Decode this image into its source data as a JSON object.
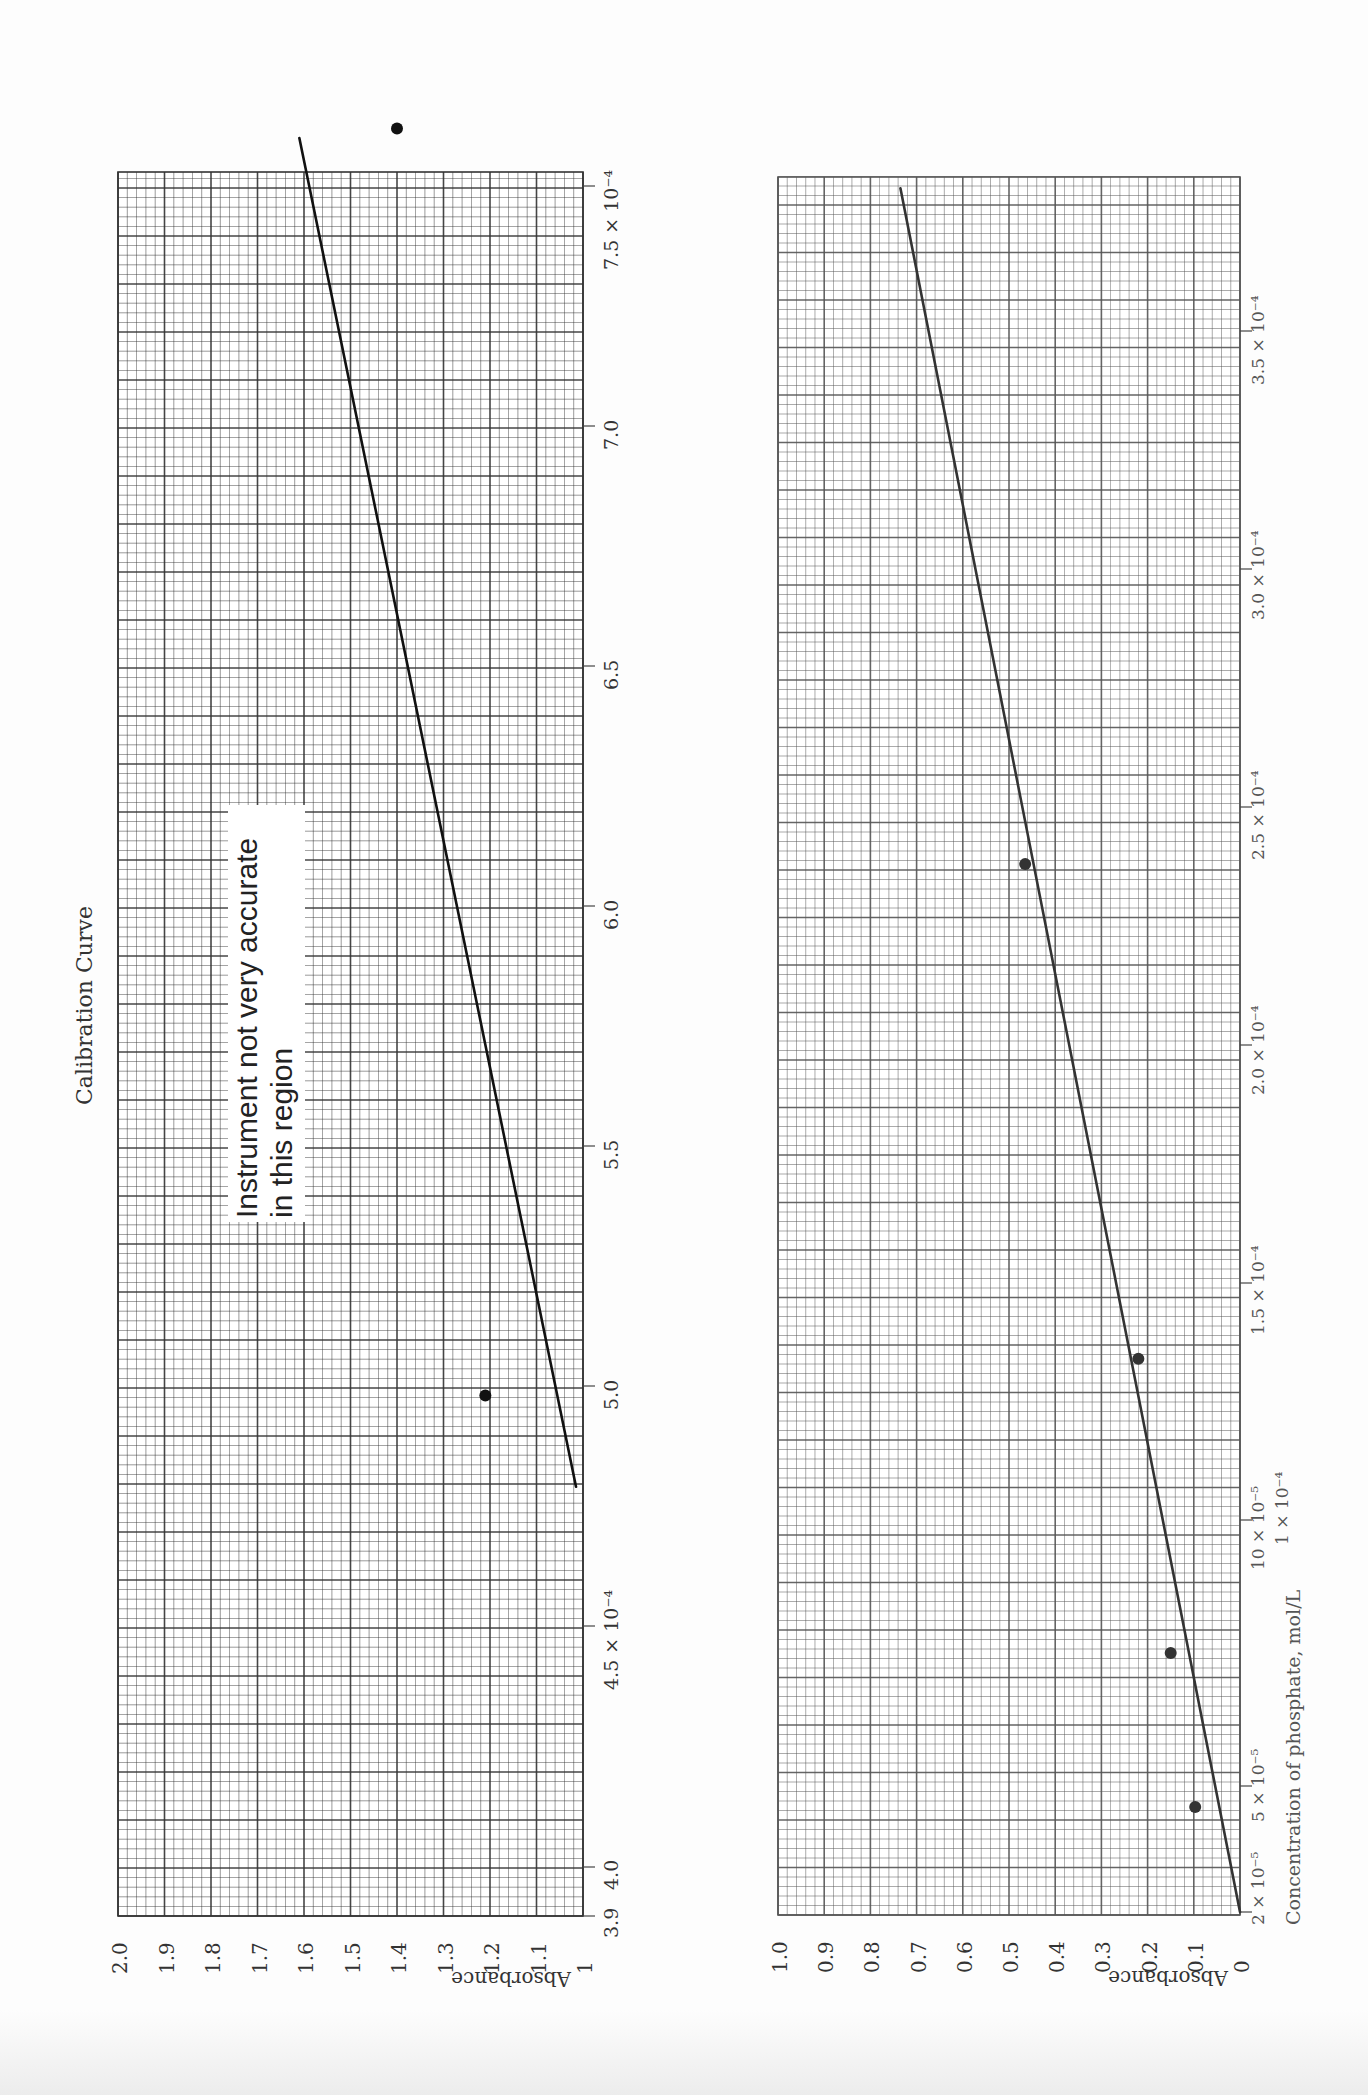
{
  "title": "Calibration Curve",
  "annotation": [
    "Instrument not very accurate",
    "in this region"
  ],
  "chart_data": [
    {
      "type": "scatter",
      "title": "Calibration Curve",
      "xlabel": "",
      "ylabel": "Absorbance",
      "xlim": [
        0.00039,
        0.000765
      ],
      "ylim": [
        1.0,
        2.0
      ],
      "x_tick_labels": [
        "3.9",
        "4.0",
        "4.5 × 10⁻⁴",
        "5.0",
        "5.5",
        "6.0",
        "6.5",
        "7.0",
        "7.5 × 10⁻⁴"
      ],
      "x_ticks": [
        0.00039,
        0.0004,
        0.00045,
        0.0005,
        0.00055,
        0.0006,
        0.00065,
        0.0007,
        0.00075
      ],
      "y_tick_labels": [
        "2.0",
        "1.9",
        "1.8",
        "1.7",
        "1.6",
        "1.5",
        "1.4",
        "1.3",
        "1.2",
        "1.1",
        "1"
      ],
      "y_ticks": [
        2.0,
        1.9,
        1.8,
        1.7,
        1.6,
        1.5,
        1.4,
        1.3,
        1.2,
        1.1,
        1.0
      ],
      "grid": true,
      "points": [
        {
          "x": 0.000498,
          "y": 1.21
        },
        {
          "x": 0.000762,
          "y": 1.4
        }
      ],
      "fit_line": {
        "x": [
          0.000479,
          0.00076
        ],
        "y": [
          1.015,
          1.61
        ]
      },
      "annotation": "Instrument not very accurate in this region"
    },
    {
      "type": "scatter",
      "title": "",
      "xlabel": "Concentration of phosphate, mol/L",
      "ylabel": "Absorbance",
      "xlim": [
        2e-05,
        0.000385
      ],
      "ylim": [
        0.0,
        1.0
      ],
      "x_tick_labels": [
        "2 × 10⁻⁵",
        "5 × 10⁻⁵",
        "10 × 10⁻⁵ / 1 × 10⁻⁴",
        "1.5 × 10⁻⁴",
        "2.0 × 10⁻⁴",
        "2.5 × 10⁻⁴",
        "3.0 × 10⁻⁴",
        "3.5 × 10⁻⁴"
      ],
      "x_ticks": [
        2e-05,
        5e-05,
        0.0001,
        0.00015,
        0.0002,
        0.00025,
        0.0003,
        0.00035
      ],
      "y_tick_labels": [
        "1.0",
        "0.9",
        "0.8",
        "0.7",
        "0.6",
        "0.5",
        "0.4",
        "0.3",
        "0.2",
        "0.1",
        "0"
      ],
      "y_ticks": [
        1.0,
        0.9,
        0.8,
        0.7,
        0.6,
        0.5,
        0.4,
        0.3,
        0.2,
        0.1,
        0.0
      ],
      "grid": true,
      "points": [
        {
          "x": 4.5e-05,
          "y": 0.097
        },
        {
          "x": 7.5e-05,
          "y": 0.15
        },
        {
          "x": 0.000134,
          "y": 0.22
        },
        {
          "x": 0.000238,
          "y": 0.465
        }
      ],
      "fit_line": {
        "x": [
          2e-05,
          0.00038
        ],
        "y": [
          0.0,
          0.735
        ]
      }
    }
  ],
  "layout": {
    "charts": [
      {
        "grid_left": 118,
        "grid_right": 583,
        "grid_top": 172,
        "grid_bottom": 1916,
        "abs_at_left": 2.0,
        "abs_at_right": 1.0,
        "conc_at_bottom": 0.00039,
        "conc_per_px": 1.0417e-07,
        "tick_positions_y": [
          1916,
          1867,
          1626,
          1386,
          1146,
          906,
          666,
          426,
          186
        ],
        "line_color": "#111111",
        "grid_color": "#333333"
      },
      {
        "grid_left": 778,
        "grid_right": 1240,
        "grid_top": 177,
        "grid_bottom": 1915,
        "abs_at_left": 1.0,
        "abs_at_right": 0.0,
        "tick_positions_y": [
          1912,
          1786,
          1520,
          1283,
          1045,
          807,
          569,
          331
        ],
        "line_color": "#333333",
        "grid_color": "#555555"
      }
    ]
  }
}
